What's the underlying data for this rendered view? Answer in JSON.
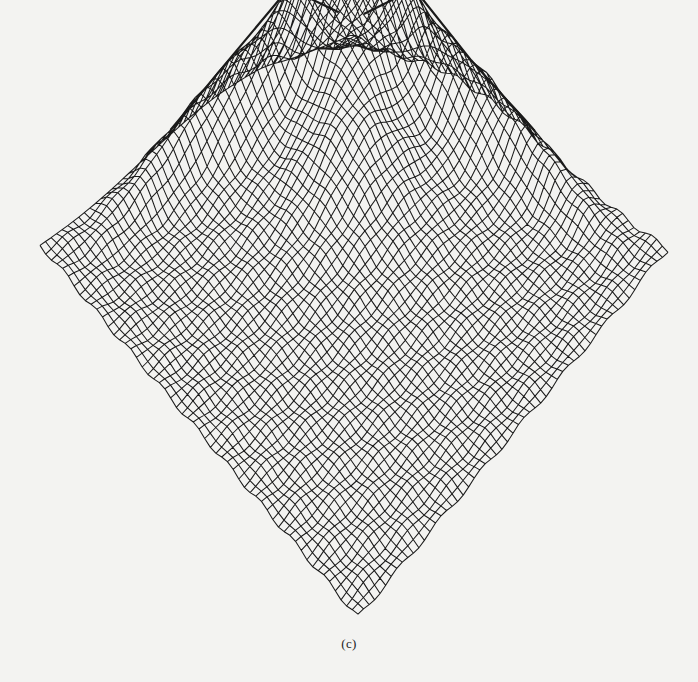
{
  "figure": {
    "caption": "(c)",
    "plot_type": "3d-wireframe-surface",
    "colors": {
      "background": "#f3f3f1",
      "mesh_line": "#1a1a1a"
    },
    "footprint_corners": {
      "top": [
        350,
        44
      ],
      "left": [
        40,
        246
      ],
      "right": [
        668,
        250
      ],
      "bottom": [
        358,
        617
      ]
    },
    "grid_resolution": 56
  }
}
